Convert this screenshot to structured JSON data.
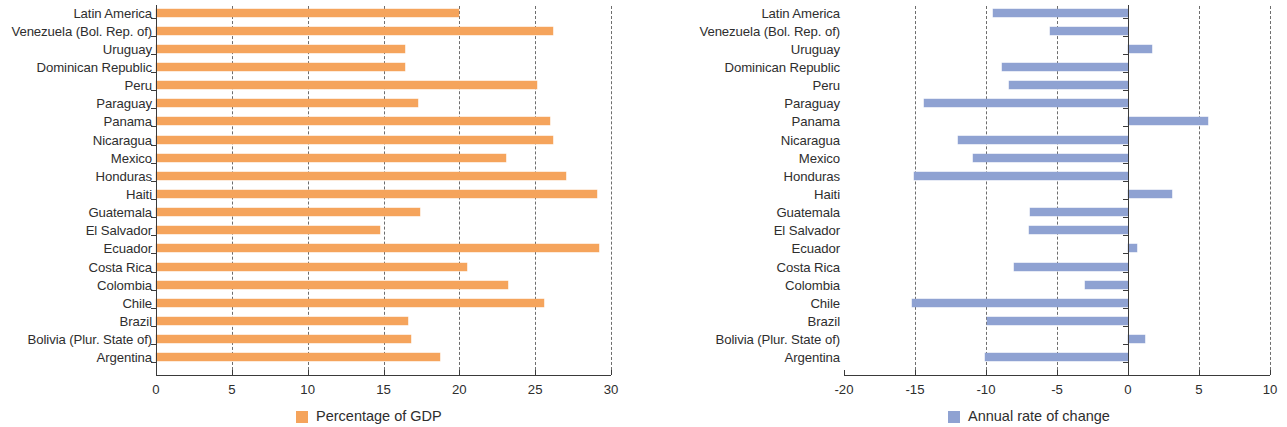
{
  "chart_data": [
    {
      "type": "bar",
      "orientation": "horizontal",
      "title": "",
      "xlabel": "",
      "ylabel": "",
      "legend": "Percentage of GDP",
      "legend_position": "bottom-center",
      "series_color": "#f5a45c",
      "grid": true,
      "xlim": [
        0,
        30
      ],
      "xticks": [
        0,
        5,
        10,
        15,
        20,
        25,
        30
      ],
      "xtick_labels": [
        "0",
        "5",
        "10",
        "15",
        "20",
        "25",
        "30"
      ],
      "categories": [
        "Latin America",
        "Venezuela (Bol. Rep. of)",
        "Uruguay",
        "Dominican Republic",
        "Peru",
        "Paraguay",
        "Panama",
        "Nicaragua",
        "Mexico",
        "Honduras",
        "Haiti",
        "Guatemala",
        "El Salvador",
        "Ecuador",
        "Costa Rica",
        "Colombia",
        "Chile",
        "Brazil",
        "Bolivia (Plur. State of)",
        "Argentina"
      ],
      "values": [
        20.0,
        26.2,
        16.4,
        16.4,
        25.1,
        17.3,
        26.0,
        26.2,
        23.1,
        27.0,
        29.1,
        17.4,
        14.8,
        29.2,
        20.5,
        23.2,
        25.6,
        16.6,
        16.8,
        18.7
      ]
    },
    {
      "type": "bar",
      "orientation": "horizontal",
      "title": "",
      "xlabel": "",
      "ylabel": "",
      "legend": "Annual rate of change",
      "legend_position": "bottom-center",
      "series_color": "#8fa2d2",
      "grid": true,
      "xlim": [
        -20,
        10
      ],
      "xticks": [
        -20,
        -15,
        -10,
        -5,
        0,
        5,
        10
      ],
      "xtick_labels": [
        "-20",
        "-15",
        "-10",
        "-5",
        "0",
        "5",
        "10"
      ],
      "categories": [
        "Latin America",
        "Venezuela (Bol. Rep. of)",
        "Uruguay",
        "Dominican Republic",
        "Peru",
        "Paraguay",
        "Panama",
        "Nicaragua",
        "Mexico",
        "Honduras",
        "Haiti",
        "Guatemala",
        "El Salvador",
        "Ecuador",
        "Costa Rica",
        "Colombia",
        "Chile",
        "Brazil",
        "Bolivia (Plur. State of)",
        "Argentina"
      ],
      "values": [
        -9.5,
        -5.5,
        1.7,
        -8.9,
        -8.4,
        -14.4,
        5.6,
        -12.0,
        -10.9,
        -15.1,
        3.1,
        -6.9,
        -7.0,
        0.6,
        -8.0,
        -3.0,
        -15.2,
        -9.9,
        1.2,
        -10.1
      ]
    }
  ]
}
